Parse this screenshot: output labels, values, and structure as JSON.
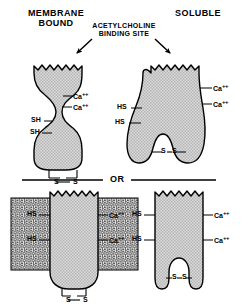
{
  "figure": {
    "title_left": "MEMBRANE\nBOUND",
    "title_left_line1": "MEMBRANE",
    "title_left_line2": "BOUND",
    "title_right": "SOLUBLE",
    "callout_line1": "ACETYLCHOLINE",
    "callout_line2": "BINDING   SITE",
    "divider_label": "OR"
  },
  "panels": {
    "top_left": {
      "name": "membrane-bound-s-shaped-enzyme",
      "thiol_labels": [
        "SH",
        "SH"
      ],
      "calcium_labels": [
        "Ca",
        "Ca"
      ],
      "calcium_charge": "++",
      "disulfide_label_left": "S",
      "disulfide_label_right": "S",
      "disulfide_dash": "—"
    },
    "top_right": {
      "name": "soluble-tooth-shaped-enzyme",
      "thiol_labels": [
        "HS",
        "HS"
      ],
      "calcium_labels": [
        "Ca",
        "Ca"
      ],
      "calcium_charge": "++",
      "disulfide_label_left": "S",
      "disulfide_label_right": "S",
      "disulfide_dash": "—"
    },
    "bottom_left": {
      "name": "membrane-embedded-enzyme",
      "thiol_labels": [
        "HS",
        "HS"
      ],
      "calcium_labels": [
        "Ca",
        "Ca"
      ],
      "calcium_charge": "++",
      "disulfide_label_left": "S",
      "disulfide_label_right": "S",
      "disulfide_dash": "—"
    },
    "bottom_right": {
      "name": "soluble-notched-enzyme",
      "thiol_labels": [
        "HS",
        "HS"
      ],
      "calcium_labels": [
        "Ca",
        "Ca"
      ],
      "calcium_charge": "++",
      "disulfide_label_left": "S",
      "disulfide_label_right": "S",
      "disulfide_dash": "—"
    }
  },
  "colors": {
    "protein_fill": "#d4d4d4",
    "outline": "#000000",
    "membrane_fill": "#e8e8e8",
    "background": "#ffffff",
    "text": "#000000"
  }
}
